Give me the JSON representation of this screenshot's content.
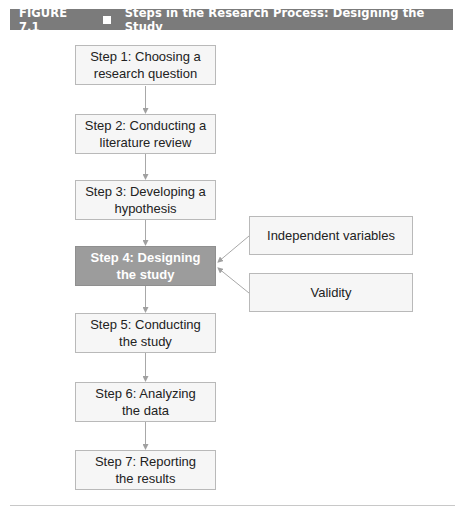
{
  "figure": {
    "number": "FIGURE 7.1",
    "bullet_icon": "square-bullet-icon",
    "title": "Steps in the Research Process: Designing the Study"
  },
  "steps": [
    {
      "label": "Step 1: Choosing a\nresearch question",
      "highlighted": false
    },
    {
      "label": "Step 2: Conducting a\nliterature review",
      "highlighted": false
    },
    {
      "label": "Step 3: Developing a\nhypothesis",
      "highlighted": false
    },
    {
      "label": "Step 4: Designing\nthe study",
      "highlighted": true
    },
    {
      "label": "Step 5: Conducting\nthe study",
      "highlighted": false
    },
    {
      "label": "Step 6: Analyzing\nthe data",
      "highlighted": false
    },
    {
      "label": "Step 7: Reporting\nthe results",
      "highlighted": false
    }
  ],
  "side_topics": [
    {
      "label": "Independent variables"
    },
    {
      "label": "Validity"
    }
  ],
  "colors": {
    "header_bg": "#7b7b7b",
    "highlight_bg": "#9c9c9c",
    "box_bg": "#f6f6f6",
    "box_border": "#b9b9b9",
    "arrow": "#a0a0a0"
  }
}
